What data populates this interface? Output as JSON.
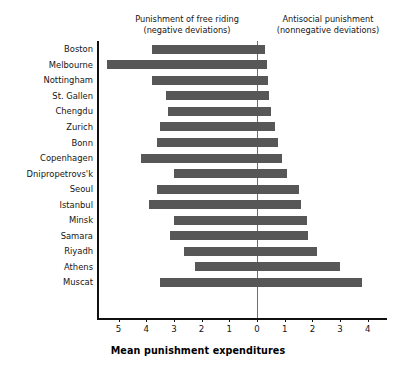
{
  "chart_data": {
    "type": "bar",
    "orientation": "horizontal",
    "title": "",
    "xlabel": "Mean punishment expenditures",
    "ylabel": "",
    "xlim": [
      -5.75,
      4.35
    ],
    "xticks": [
      -5,
      -4,
      -3,
      -2,
      -1,
      0,
      1,
      2,
      3,
      4
    ],
    "xticklabels": [
      "5",
      "4",
      "3",
      "2",
      "1",
      "0",
      "1",
      "2",
      "3",
      "4"
    ],
    "grid": false,
    "legend": null,
    "zero_line": true,
    "bar_color": "#575757",
    "categories": [
      "Boston",
      "Melbourne",
      "Nottingham",
      "St. Gallen",
      "Chengdu",
      "Zurich",
      "Bonn",
      "Copenhagen",
      "Dnipropetrovs'k",
      "Seoul",
      "Istanbul",
      "Minsk",
      "Samara",
      "Riyadh",
      "Athens",
      "Muscat"
    ],
    "series": [
      {
        "name": "Punishment of free riding (negative deviations)",
        "side": "left",
        "values": [
          -3.8,
          -5.4,
          -3.8,
          -3.3,
          -3.2,
          -3.5,
          -3.6,
          -4.2,
          -3.0,
          -3.6,
          -3.9,
          -3.0,
          -3.15,
          -2.65,
          -2.25,
          -3.5
        ]
      },
      {
        "name": "Antisocial punishment (nonnegative deviations)",
        "side": "right",
        "values": [
          0.3,
          0.35,
          0.4,
          0.45,
          0.5,
          0.65,
          0.75,
          0.9,
          1.1,
          1.5,
          1.6,
          1.8,
          1.85,
          2.15,
          3.0,
          3.8
        ]
      }
    ]
  },
  "headers": {
    "left_title": "Punishment of free riding",
    "left_subtitle": "(negative deviations)",
    "right_title": "Antisocial punishment",
    "right_subtitle": "(nonnegative deviations)"
  }
}
